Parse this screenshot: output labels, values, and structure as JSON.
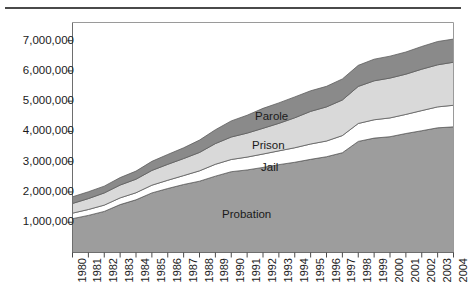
{
  "page": {
    "top_rule": "horizontal-rule"
  },
  "chart_data": {
    "type": "area",
    "stacked": true,
    "title": "",
    "subtitle": "",
    "xlabel": "",
    "ylabel": "",
    "grid": false,
    "legend_position": "inline-labels",
    "xlim": [
      1980,
      2004
    ],
    "ylim": [
      0,
      7600000
    ],
    "yticks": [
      1000000,
      2000000,
      3000000,
      4000000,
      5000000,
      6000000,
      7000000
    ],
    "ytick_labels": [
      "1,000,000",
      "2,000,000",
      "3,000,000",
      "4,000,000",
      "5,000,000",
      "6,000,000",
      "7,000,000"
    ],
    "categories": [
      "1980",
      "1981",
      "1982",
      "1983",
      "1984",
      "1985",
      "1986",
      "1987",
      "1988",
      "1989",
      "1990",
      "1991",
      "1992",
      "1993",
      "1994",
      "1995",
      "1996",
      "1997",
      "1998",
      "1999",
      "2000",
      "2001",
      "2002",
      "2003",
      "2004"
    ],
    "series": [
      {
        "name": "Probation",
        "color": "#9d9d9d",
        "values": [
          1118097,
          1225934,
          1357264,
          1582947,
          1740948,
          1968712,
          2114621,
          2247158,
          2356483,
          2522125,
          2670234,
          2728472,
          2811611,
          2903061,
          2981022,
          3077861,
          3164996,
          3296513,
          3670441,
          3779922,
          3826209,
          3931731,
          4024067,
          4120012,
          4151125
        ]
      },
      {
        "name": "Jail",
        "color": "#ffffff",
        "values": [
          182288,
          195085,
          207853,
          221815,
          233018,
          254986,
          272735,
          294092,
          341893,
          393303,
          403019,
          424129,
          441781,
          455500,
          479800,
          507044,
          518492,
          567079,
          592462,
          605943,
          621149,
          631240,
          665475,
          691301,
          713990
        ]
      },
      {
        "name": "Prison",
        "color": "#d9d9d9",
        "values": [
          319598,
          360029,
          402914,
          423898,
          448264,
          487593,
          526436,
          562814,
          607766,
          683367,
          743382,
          792535,
          850566,
          909381,
          990147,
          1078542,
          1127528,
          1176564,
          1224469,
          1287172,
          1316333,
          1330007,
          1367547,
          1390279,
          1421911
        ]
      },
      {
        "name": "Parole",
        "color": "#8a8a8a",
        "values": [
          220438,
          225539,
          224604,
          246440,
          266992,
          300203,
          325638,
          355505,
          407977,
          456803,
          531407,
          590442,
          658601,
          676100,
          690371,
          679421,
          679733,
          694787,
          696385,
          714457,
          723898,
          732333,
          750934,
          769925,
          765355
        ]
      }
    ],
    "series_inline_labels": [
      {
        "name": "Parole",
        "x": 255,
        "y": 110
      },
      {
        "name": "Prison",
        "x": 252,
        "y": 139
      },
      {
        "name": "Jail",
        "x": 261,
        "y": 161
      },
      {
        "name": "Probation",
        "x": 222,
        "y": 208
      }
    ],
    "totals": [
      1840421,
      2006587,
      2192635,
      2475100,
      2689222,
      3011494,
      3239430,
      3459569,
      3714119,
      4055598,
      4348042,
      4535578,
      4762559,
      4944042,
      5141340,
      5342868,
      5490749,
      5734943,
      6183757,
      6387494,
      6487589,
      6625311,
      6808023,
      6971517,
      7052381
    ]
  }
}
